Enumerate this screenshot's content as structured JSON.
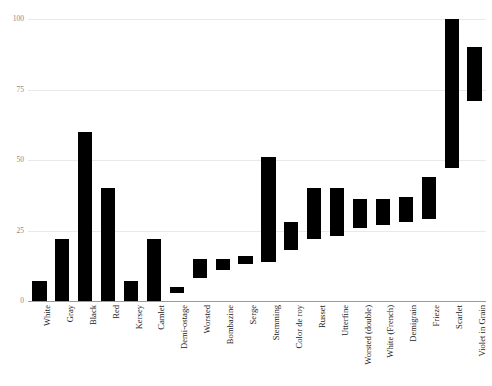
{
  "chart_data": {
    "type": "bar",
    "bar_style": "floating-range",
    "title": "",
    "subtitle": "",
    "xlabel": "",
    "ylabel": "",
    "ylim": [
      0,
      100
    ],
    "yticks": [
      "0",
      "25",
      "50",
      "75",
      "100"
    ],
    "ytick_values": [
      0,
      25,
      50,
      75,
      100
    ],
    "grid": true,
    "legend": "none",
    "bar_color": "#000000",
    "grid_color": "#e9e9e9",
    "axis_color": "#9a9a9a",
    "categories": [
      "White",
      "Gray",
      "Black",
      "Red",
      "Kersey",
      "Camlet",
      "Demi-ostage",
      "Worsted",
      "Bombazine",
      "Serge",
      "Stemming",
      "Color de roy",
      "Russet",
      "Utterfine",
      "Worsted (double)",
      "White (French)",
      "Demigrain",
      "Frieze",
      "Scarlet",
      "Violet in Grain"
    ],
    "low": [
      0,
      0,
      0,
      0,
      0,
      0,
      3,
      8,
      11,
      13,
      14,
      18,
      22,
      23,
      26,
      27,
      28,
      29,
      47,
      71
    ],
    "high": [
      7,
      22,
      60,
      40,
      7,
      22,
      5,
      15,
      15,
      16,
      51,
      28,
      40,
      40,
      36,
      36,
      37,
      44,
      100,
      90
    ],
    "series": [
      {
        "name": "Range low",
        "values": [
          0,
          0,
          0,
          0,
          0,
          0,
          3,
          8,
          11,
          13,
          14,
          18,
          22,
          23,
          26,
          27,
          28,
          29,
          47,
          71
        ]
      },
      {
        "name": "Range high",
        "values": [
          7,
          22,
          60,
          40,
          7,
          22,
          5,
          15,
          15,
          16,
          51,
          28,
          40,
          40,
          36,
          36,
          37,
          44,
          100,
          90
        ]
      }
    ]
  }
}
